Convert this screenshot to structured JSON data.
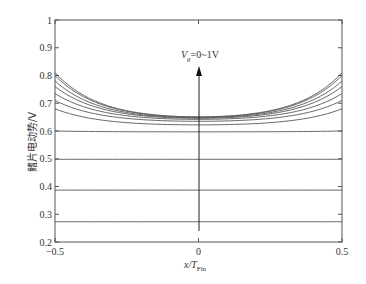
{
  "chart_data": {
    "type": "line",
    "title": "",
    "xlabel": "x/T_Fin",
    "xlabel_main": "x/T",
    "xlabel_sub": "Fin",
    "ylabel": "鳍片电动势/V",
    "xlim": [
      -0.5,
      0.5
    ],
    "ylim": [
      0.2,
      1.0
    ],
    "xticks": [
      -0.5,
      0,
      0.5
    ],
    "xtick_labels": [
      "−0.5",
      "0",
      "0.5"
    ],
    "yticks": [
      0.2,
      0.3,
      0.4,
      0.5,
      0.6,
      0.7,
      0.8,
      0.9,
      1.0
    ],
    "ytick_labels": [
      "0.2",
      "0.3",
      "0.4",
      "0.5",
      "0.6",
      "0.7",
      "0.8",
      "0.9",
      "1"
    ],
    "grid": false,
    "legend": null,
    "annotation": {
      "text_main": "V",
      "text_sub": "g",
      "text_rest": "=0~1V",
      "full_text": "Vg=0~1V",
      "arrow": {
        "x": 0,
        "from_y": 0.24,
        "to_y": 0.83,
        "direction": "up"
      }
    },
    "series": [
      {
        "name": "curve-1",
        "edge": 0.273,
        "center": 0.273
      },
      {
        "name": "curve-2",
        "edge": 0.387,
        "center": 0.387
      },
      {
        "name": "curve-3",
        "edge": 0.498,
        "center": 0.498
      },
      {
        "name": "curve-4",
        "edge": 0.6,
        "center": 0.597
      },
      {
        "name": "curve-5",
        "edge": 0.68,
        "center": 0.622
      },
      {
        "name": "curve-6",
        "edge": 0.71,
        "center": 0.635
      },
      {
        "name": "curve-7",
        "edge": 0.735,
        "center": 0.642
      },
      {
        "name": "curve-8",
        "edge": 0.76,
        "center": 0.646
      },
      {
        "name": "curve-9",
        "edge": 0.78,
        "center": 0.648
      },
      {
        "name": "curve-10",
        "edge": 0.8,
        "center": 0.65
      },
      {
        "name": "curve-11",
        "edge": 0.81,
        "center": 0.651
      }
    ]
  }
}
